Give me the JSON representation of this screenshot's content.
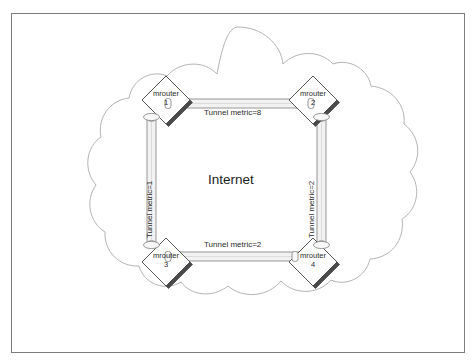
{
  "diagram": {
    "title_label": "Internet",
    "frame": {
      "border_color": "#7d7d7d"
    },
    "colors": {
      "cloud_outline": "#b4b4b4",
      "node_outline": "#555555",
      "node_fill": "#ffffff",
      "node_shadow": "#4a4a4a",
      "pipe_outline": "#8c8c8c",
      "pipe_fill": "#f2f2f2",
      "text": "#2a2a2a"
    },
    "nodes": [
      {
        "id": "mrouter-1",
        "name": "mrouter",
        "number": "1",
        "icon": "router-diamond-icon"
      },
      {
        "id": "mrouter-2",
        "name": "mrouter",
        "number": "2",
        "icon": "router-diamond-icon"
      },
      {
        "id": "mrouter-3",
        "name": "mrouter",
        "number": "3",
        "icon": "router-diamond-icon"
      },
      {
        "id": "mrouter-4",
        "name": "mrouter",
        "number": "4",
        "icon": "router-diamond-icon"
      }
    ],
    "links": [
      {
        "id": "link-top",
        "label": "Tunnel metric=8",
        "metric": 8,
        "from": "mrouter-1",
        "to": "mrouter-2",
        "orientation": "horizontal"
      },
      {
        "id": "link-left",
        "label": "Tunnel metric=1",
        "metric": 1,
        "from": "mrouter-1",
        "to": "mrouter-3",
        "orientation": "vertical"
      },
      {
        "id": "link-right",
        "label": "Tunnel metric=2",
        "metric": 2,
        "from": "mrouter-2",
        "to": "mrouter-4",
        "orientation": "vertical"
      },
      {
        "id": "link-bottom",
        "label": "Tunnel metric=2",
        "metric": 2,
        "from": "mrouter-3",
        "to": "mrouter-4",
        "orientation": "horizontal"
      }
    ]
  }
}
